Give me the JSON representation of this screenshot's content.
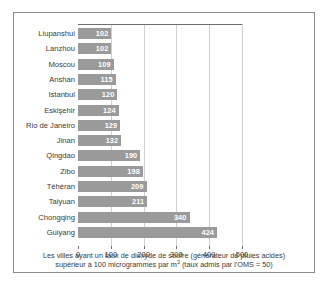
{
  "chart_data": {
    "type": "bar",
    "orientation": "horizontal",
    "title": "",
    "subtitle": "",
    "xlabel": "",
    "ylabel": "",
    "xlim": [
      0,
      500
    ],
    "xticks": [
      "0",
      "100",
      "200",
      "300",
      "400",
      "500"
    ],
    "grid": "vertical",
    "legend": "none",
    "bar_color": "#9a9a9a",
    "value_label_color": "#ffffff",
    "gridline_color": "#cfcfcf",
    "axis_color": "#6e6e6e",
    "frame_color": "#8d8d8d",
    "categories": [
      "Liupanshui",
      "Lanzhou",
      "Moscou",
      "Anshan",
      "Istanbul",
      "Eskişehir",
      "Rio de Janeiro",
      "Jinan",
      "Qingdao",
      "Zibo",
      "Téhéran",
      "Taiyuan",
      "Chongqing",
      "Guiyang"
    ],
    "values": [
      102,
      102,
      109,
      115,
      120,
      124,
      129,
      132,
      190,
      198,
      209,
      211,
      340,
      424
    ]
  },
  "caption": {
    "line1": "Les villes ayant un taux de dioxyde de soufre (générateur de pluies acides)",
    "line2_before_sup": "supérieur à 100 microgrammes par m",
    "line2_sup": "3",
    "line2_after_sup": " (taux admis par l'OMS = 50)"
  }
}
